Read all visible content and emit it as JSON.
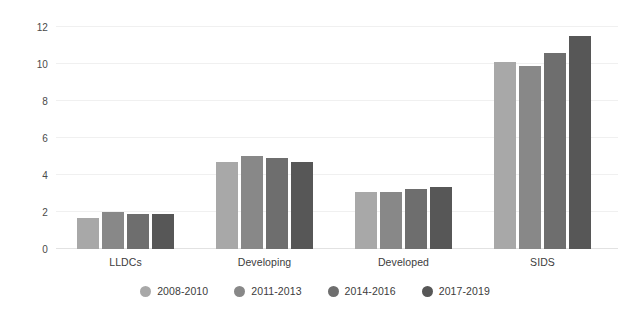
{
  "chart_data": {
    "type": "bar",
    "title": "",
    "subtitle": "",
    "xlabel": "",
    "ylabel": "",
    "ylim": [
      0,
      12
    ],
    "ytick_labels": [
      "0",
      "2",
      "4",
      "6",
      "8",
      "10",
      "12"
    ],
    "yticks": [
      0,
      2,
      4,
      6,
      8,
      10,
      12
    ],
    "grid": true,
    "grid_axis": "y",
    "legend_position": "bottom",
    "orientation": "vertical",
    "grouping": "grouped",
    "categories": [
      "LLDCs",
      "Developing",
      "Developed",
      "SIDS"
    ],
    "series": [
      {
        "name": "2008-2010",
        "color": "#a8a8a8",
        "values": [
          1.7,
          4.7,
          3.1,
          10.1
        ]
      },
      {
        "name": "2011-2013",
        "color": "#888888",
        "values": [
          2.0,
          5.05,
          3.1,
          9.9
        ]
      },
      {
        "name": "2014-2016",
        "color": "#6e6e6e",
        "values": [
          1.9,
          4.9,
          3.25,
          10.6
        ]
      },
      {
        "name": "2017-2019",
        "color": "#575757",
        "values": [
          1.9,
          4.7,
          3.35,
          11.5
        ]
      }
    ]
  },
  "colors": {
    "background": "#ffffff",
    "gridline": "#f0f0f0",
    "baseline": "#e2e2e2",
    "tick_text": "#4a4a4a",
    "label_text": "#3c3c3c"
  }
}
